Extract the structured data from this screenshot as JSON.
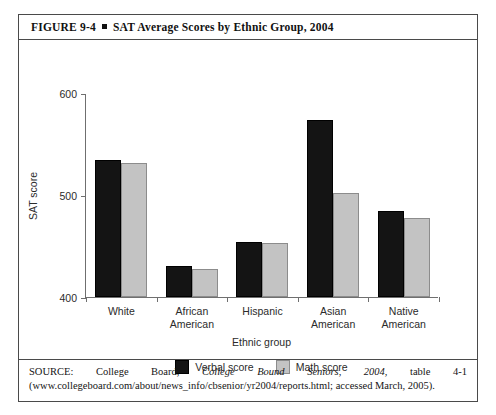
{
  "figure": {
    "number": "FIGURE 9-4",
    "separator": "square-bullet",
    "title": "SAT Average Scores by Ethnic Group, 2004"
  },
  "source": {
    "prefix": "SOURCE: College Board, ",
    "italic_title": "College Bound Seniors, 2004",
    "suffix": ", table 4-1 (www.collegeboard.com/about/news_info/cbsenior/yr2004/reports.html; accessed March, 2005)."
  },
  "chart_data": {
    "type": "bar",
    "title": "SAT Average Scores by Ethnic Group, 2004",
    "xlabel": "Ethnic group",
    "ylabel": "SAT score",
    "ylim": [
      400,
      600
    ],
    "yticks": [
      400,
      500,
      600
    ],
    "grid": false,
    "legend_position": "bottom-center",
    "categories": [
      "White",
      "African American",
      "Hispanic",
      "Asian American",
      "Native American"
    ],
    "categories_lines": [
      [
        "White"
      ],
      [
        "African",
        "American"
      ],
      [
        "Hispanic"
      ],
      [
        "Asian",
        "American"
      ],
      [
        "Native",
        "American"
      ]
    ],
    "series": [
      {
        "name": "Verbal score",
        "color": "#141414",
        "values": [
          534,
          430,
          454,
          574,
          484
        ]
      },
      {
        "name": "Math score",
        "color": "#c3c3c3",
        "values": [
          531,
          427,
          453,
          502,
          477
        ]
      }
    ]
  }
}
